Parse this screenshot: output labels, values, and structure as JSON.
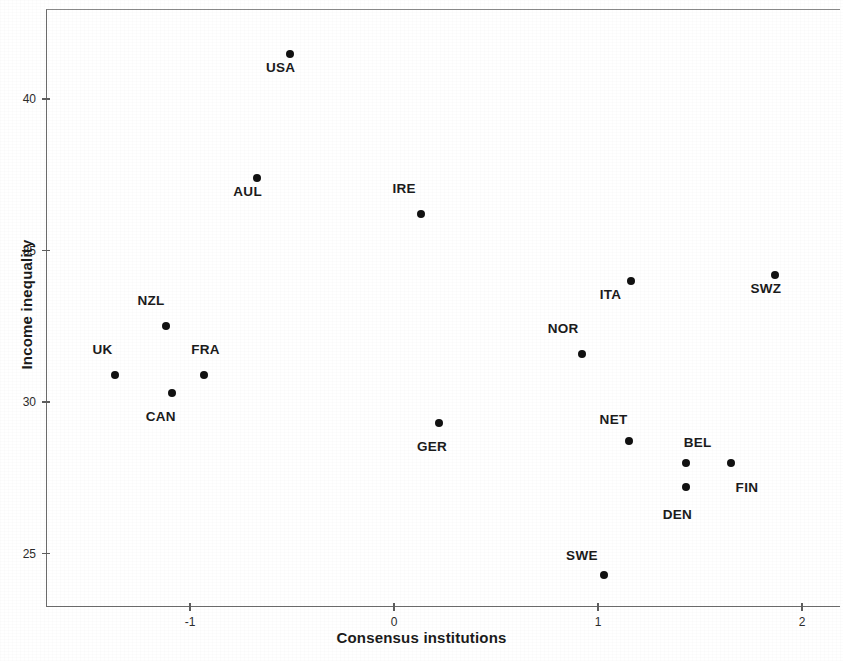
{
  "chart_data": {
    "type": "scatter",
    "title": "",
    "xlabel": "Consensus institutions",
    "ylabel": "Income inequality",
    "xlim": [
      -1.71,
      2.16
    ],
    "ylim": [
      23.6,
      42.6
    ],
    "xticks": [
      -1,
      0,
      1,
      2
    ],
    "xtick_labels": [
      "-1",
      "0",
      "1",
      "2"
    ],
    "yticks": [
      25,
      30,
      35,
      40
    ],
    "ytick_labels": [
      "25",
      "30",
      "35",
      "40"
    ],
    "grid": false,
    "legend": null,
    "points": [
      {
        "label": "USA",
        "x": -0.51,
        "y": 41.5,
        "label_dx": -24,
        "label_dy": 13
      },
      {
        "label": "AUL",
        "x": -0.67,
        "y": 37.4,
        "label_dx": -24,
        "label_dy": 13
      },
      {
        "label": "IRE",
        "x": 0.13,
        "y": 36.2,
        "label_dx": -28,
        "label_dy": -26
      },
      {
        "label": "SWZ",
        "x": 1.87,
        "y": 34.2,
        "label_dx": -25,
        "label_dy": 13
      },
      {
        "label": "ITA",
        "x": 1.16,
        "y": 34.0,
        "label_dx": -31,
        "label_dy": 13
      },
      {
        "label": "NZL",
        "x": -1.12,
        "y": 32.5,
        "label_dx": -28,
        "label_dy": -26
      },
      {
        "label": "NOR",
        "x": 0.92,
        "y": 31.6,
        "label_dx": -34,
        "label_dy": -26
      },
      {
        "label": "UK",
        "x": -1.37,
        "y": 30.9,
        "label_dx": -22,
        "label_dy": -26
      },
      {
        "label": "FRA",
        "x": -0.93,
        "y": 30.9,
        "label_dx": -13,
        "label_dy": -26
      },
      {
        "label": "CAN",
        "x": -1.09,
        "y": 30.3,
        "label_dx": -26,
        "label_dy": 23
      },
      {
        "label": "GER",
        "x": 0.22,
        "y": 29.3,
        "label_dx": -22,
        "label_dy": 23
      },
      {
        "label": "NET",
        "x": 1.15,
        "y": 28.7,
        "label_dx": -29,
        "label_dy": -22
      },
      {
        "label": "BEL",
        "x": 1.43,
        "y": 28.0,
        "label_dx": -2,
        "label_dy": -21
      },
      {
        "label": "FIN",
        "x": 1.65,
        "y": 28.0,
        "label_dx": 5,
        "label_dy": 24
      },
      {
        "label": "DEN",
        "x": 1.43,
        "y": 27.2,
        "label_dx": -23,
        "label_dy": 27
      },
      {
        "label": "SWE",
        "x": 1.03,
        "y": 24.3,
        "label_dx": -38,
        "label_dy": -20
      }
    ]
  },
  "axes": {
    "x_title": "Consensus institutions",
    "y_title": "Income inequality"
  }
}
